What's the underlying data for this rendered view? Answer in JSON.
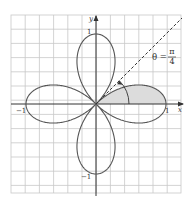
{
  "figure": {
    "curve": "r = cos(2θ)",
    "axes": {
      "x_label": "x",
      "y_label": "y",
      "x_ticks": [
        "−1",
        "1"
      ],
      "y_ticks": [
        "1",
        "−1"
      ]
    },
    "annotation": {
      "angle_label_lhs": "θ =",
      "angle_num": "π",
      "angle_den": "4"
    },
    "shaded_region": "0 ≤ θ ≤ π/4",
    "colors": {
      "curve": "#555555",
      "grid": "#c8c8c8",
      "axis": "#333333",
      "shade": "#d9d9d9",
      "dashed": "#333333"
    }
  }
}
